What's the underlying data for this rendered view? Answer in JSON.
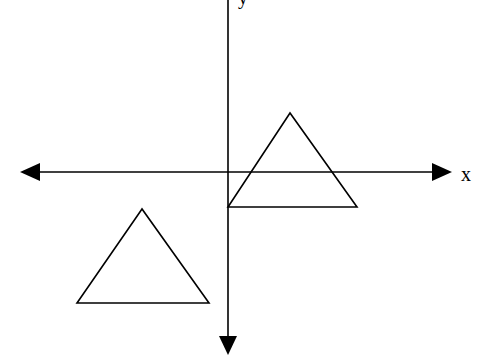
{
  "diagram": {
    "width": 480,
    "height": 356,
    "colors": {
      "stroke": "#000000",
      "background": "#ffffff"
    },
    "axes": {
      "x": {
        "label": "x",
        "y": 172,
        "x_start": 20,
        "x_end": 452,
        "arrows": "both",
        "label_pos": [
          462,
          180
        ]
      },
      "y": {
        "label": "y",
        "x": 228,
        "y_start": -10,
        "y_end": 354,
        "arrows": "down",
        "label_pos": [
          240,
          4
        ]
      }
    },
    "shapes": [
      {
        "type": "triangle",
        "name": "upper-right-triangle",
        "points": [
          [
            290,
            113
          ],
          [
            228,
            207
          ],
          [
            357,
            207
          ]
        ]
      },
      {
        "type": "triangle",
        "name": "lower-left-triangle",
        "points": [
          [
            142,
            209
          ],
          [
            77,
            303
          ],
          [
            209,
            303
          ]
        ]
      }
    ]
  }
}
